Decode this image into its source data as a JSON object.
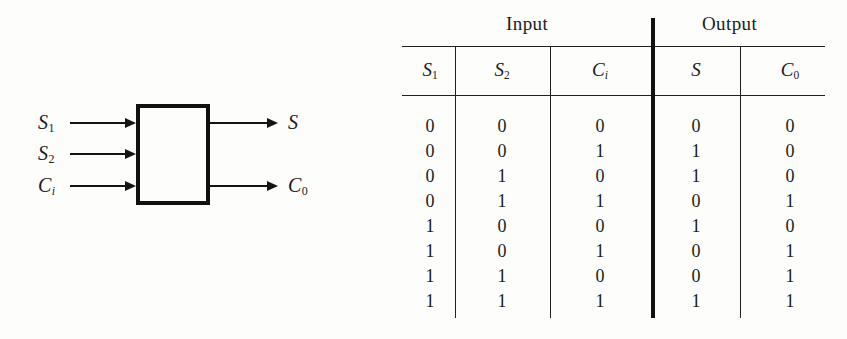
{
  "figure": {
    "diagram": {
      "block_label": "",
      "inputs": [
        {
          "name": "S1",
          "base": "S",
          "sub": "1",
          "sub_style": "upright"
        },
        {
          "name": "S2",
          "base": "S",
          "sub": "2",
          "sub_style": "upright"
        },
        {
          "name": "Ci",
          "base": "C",
          "sub": "i",
          "sub_style": "italic"
        }
      ],
      "outputs": [
        {
          "name": "S",
          "base": "S",
          "sub": "",
          "sub_style": "upright"
        },
        {
          "name": "C0",
          "base": "C",
          "sub": "0",
          "sub_style": "upright"
        }
      ]
    },
    "table": {
      "group_headers": [
        {
          "label": "Input",
          "spans": 3
        },
        {
          "label": "Output",
          "spans": 2
        }
      ],
      "columns": [
        {
          "base": "S",
          "sub": "1",
          "sub_style": "upright"
        },
        {
          "base": "S",
          "sub": "2",
          "sub_style": "upright"
        },
        {
          "base": "C",
          "sub": "i",
          "sub_style": "italic"
        },
        {
          "base": "S",
          "sub": "",
          "sub_style": "upright"
        },
        {
          "base": "C",
          "sub": "0",
          "sub_style": "upright"
        }
      ],
      "column_names": [
        "S1",
        "S2",
        "Ci",
        "S",
        "C0"
      ],
      "rows": [
        [
          "0",
          "0",
          "0",
          "0",
          "0"
        ],
        [
          "0",
          "0",
          "1",
          "1",
          "0"
        ],
        [
          "0",
          "1",
          "0",
          "1",
          "0"
        ],
        [
          "0",
          "1",
          "1",
          "0",
          "1"
        ],
        [
          "1",
          "0",
          "0",
          "1",
          "0"
        ],
        [
          "1",
          "0",
          "1",
          "0",
          "1"
        ],
        [
          "1",
          "1",
          "0",
          "0",
          "1"
        ],
        [
          "1",
          "1",
          "1",
          "1",
          "1"
        ]
      ]
    },
    "colors": {
      "ink": "#1b1b1b",
      "rule": "#20201f",
      "background": "#fdfdfc"
    }
  }
}
